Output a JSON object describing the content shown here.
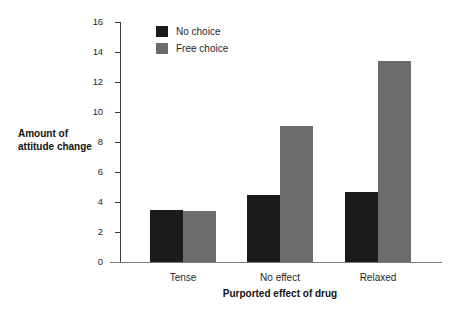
{
  "chart_data": {
    "type": "bar",
    "title": "",
    "subtitle": "",
    "xlabel": "Purported effect of drug",
    "ylabel": "Amount of attitude change",
    "ylabel_line1": "Amount of",
    "ylabel_line2": "attitude change",
    "categories": [
      "Tense",
      "No effect",
      "Relaxed"
    ],
    "series": [
      {
        "name": "No choice",
        "color": "#1b1b1b",
        "values": [
          3.5,
          4.5,
          4.7
        ]
      },
      {
        "name": "Free choice",
        "color": "#6c6c6c",
        "values": [
          3.4,
          9.1,
          13.4
        ]
      }
    ],
    "ylim": [
      0,
      16
    ],
    "ytick_labels": [
      "0",
      "2",
      "4",
      "6",
      "8",
      "10",
      "12",
      "14",
      "16"
    ],
    "ytick_values": [
      0,
      2,
      4,
      6,
      8,
      10,
      12,
      14,
      16
    ],
    "grid": false,
    "legend_position": "top-left-inside",
    "legend_entries": [
      "No choice",
      "Free choice"
    ],
    "axis_color": "#3c3c3c",
    "background": "#ffffff"
  }
}
